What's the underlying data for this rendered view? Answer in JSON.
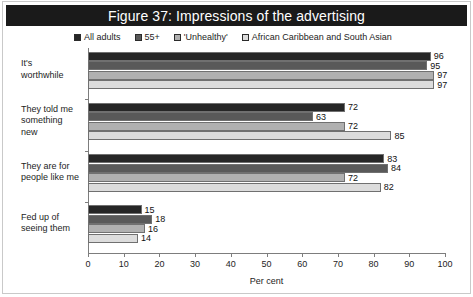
{
  "figure": {
    "title": "Figure 37: Impressions of the advertising",
    "title_bg": "#1a1a1a",
    "title_color": "#ffffff"
  },
  "chart_data": {
    "type": "bar",
    "orientation": "horizontal",
    "title": "Figure 37: Impressions of the advertising",
    "xlabel": "Per cent",
    "ylabel": "",
    "xlim": [
      0,
      100
    ],
    "xticks": [
      0,
      10,
      20,
      30,
      40,
      50,
      60,
      70,
      80,
      90,
      100
    ],
    "grid": false,
    "legend_position": "top",
    "categories": [
      "It's worthwhile",
      "They told me something new",
      "They are for people like me",
      "Fed up of seeing them"
    ],
    "series": [
      {
        "name": "All adults",
        "color": "#262626",
        "values": [
          96,
          72,
          83,
          15
        ]
      },
      {
        "name": "55+",
        "color": "#595959",
        "values": [
          95,
          63,
          84,
          18
        ]
      },
      {
        "name": "'Unhealthy'",
        "color": "#b0b0b0",
        "values": [
          97,
          72,
          72,
          16
        ]
      },
      {
        "name": "African Caribbean and South Asian",
        "color": "#dcdcdc",
        "values": [
          97,
          85,
          82,
          14
        ]
      }
    ]
  },
  "legend": {
    "items": [
      {
        "label": "All adults"
      },
      {
        "label": "55+"
      },
      {
        "label": "'Unhealthy'"
      },
      {
        "label": "African Caribbean and South Asian"
      }
    ]
  },
  "axis": {
    "x_title": "Per cent",
    "x_tick_labels": [
      "0",
      "10",
      "20",
      "30",
      "40",
      "50",
      "60",
      "70",
      "80",
      "90",
      "100"
    ]
  },
  "categories": [
    {
      "lines": [
        "It's",
        "worthwhile"
      ]
    },
    {
      "lines": [
        "They told me",
        "something",
        "new"
      ]
    },
    {
      "lines": [
        "They are for",
        "people like me"
      ]
    },
    {
      "lines": [
        "Fed up of",
        "seeing them"
      ]
    }
  ],
  "bar_labels": [
    [
      "96",
      "95",
      "97",
      "97"
    ],
    [
      "72",
      "63",
      "72",
      "85"
    ],
    [
      "83",
      "84",
      "72",
      "82"
    ],
    [
      "15",
      "18",
      "16",
      "14"
    ]
  ]
}
